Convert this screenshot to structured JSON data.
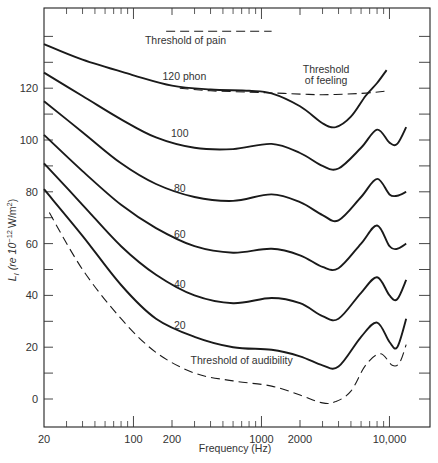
{
  "chart_data": {
    "type": "line",
    "title": "",
    "xlabel": "Frequency (Hz)",
    "ylabel": "L_I (re 10^-12 W/m^2)",
    "xscale": "log",
    "xlim": [
      20,
      16000
    ],
    "ylim": [
      -11,
      151
    ],
    "grid": false,
    "x_ticks": [
      {
        "value": 20,
        "label": "20"
      },
      {
        "value": 100,
        "label": "100"
      },
      {
        "value": 200,
        "label": "200"
      },
      {
        "value": 1000,
        "label": "1000"
      },
      {
        "value": 2000,
        "label": "2000"
      },
      {
        "value": 10000,
        "label": "10,000"
      }
    ],
    "x_minor_ticks": [
      30,
      40,
      50,
      60,
      70,
      80,
      90,
      300,
      400,
      500,
      600,
      700,
      800,
      900,
      3000,
      4000,
      5000,
      6000,
      7000,
      8000,
      9000
    ],
    "y_ticks": [
      {
        "value": 0,
        "label": "0"
      },
      {
        "value": 20,
        "label": "20"
      },
      {
        "value": 40,
        "label": "40"
      },
      {
        "value": 60,
        "label": "60"
      },
      {
        "value": 80,
        "label": "80"
      },
      {
        "value": 100,
        "label": "100"
      },
      {
        "value": 120,
        "label": "120"
      }
    ],
    "y_minor_ticks": [
      10,
      30,
      50,
      70,
      90,
      110,
      130,
      140
    ],
    "series": [
      {
        "name": "120 phon",
        "style": "solid",
        "x": [
          20,
          40,
          100,
          200,
          400,
          800,
          1200,
          2000,
          3000,
          3800,
          5000,
          6500,
          8000,
          9500
        ],
        "y": [
          137,
          131,
          125,
          121,
          119.5,
          119,
          118,
          113,
          106.5,
          105,
          109,
          117,
          122,
          127
        ]
      },
      {
        "name": "100",
        "style": "solid",
        "x": [
          20,
          40,
          80,
          150,
          300,
          600,
          1200,
          2000,
          3000,
          4000,
          6000,
          8000,
          10000,
          11500,
          13500
        ],
        "y": [
          126,
          117,
          108,
          101,
          97,
          96.5,
          98.5,
          95,
          90,
          89,
          97,
          104,
          99,
          98.5,
          105
        ]
      },
      {
        "name": "80",
        "style": "solid",
        "x": [
          20,
          40,
          80,
          150,
          300,
          600,
          1200,
          2000,
          3000,
          4000,
          6000,
          8000,
          10000,
          11500,
          13500
        ],
        "y": [
          115,
          103,
          91,
          83,
          78,
          76.5,
          79,
          76,
          71,
          69,
          78,
          85,
          79,
          78.5,
          80
        ]
      },
      {
        "name": "60",
        "style": "solid",
        "x": [
          20,
          40,
          80,
          150,
          300,
          600,
          1200,
          2000,
          3000,
          4000,
          6000,
          8000,
          10000,
          11500,
          13500
        ],
        "y": [
          102,
          88,
          75,
          66,
          59,
          56.5,
          58,
          55.5,
          51,
          50.5,
          60,
          67,
          59,
          58,
          60
        ]
      },
      {
        "name": "40",
        "style": "solid",
        "x": [
          20,
          40,
          80,
          150,
          300,
          600,
          1200,
          2000,
          3000,
          4000,
          6000,
          8000,
          10000,
          11500,
          13500
        ],
        "y": [
          91,
          75,
          59,
          48,
          40,
          37,
          39,
          37,
          32,
          31,
          41,
          47,
          40,
          38.5,
          46
        ]
      },
      {
        "name": "20",
        "style": "solid",
        "x": [
          20,
          40,
          80,
          150,
          300,
          600,
          1200,
          2000,
          3000,
          4000,
          6000,
          8000,
          10000,
          11500,
          13500
        ],
        "y": [
          81,
          63,
          44,
          31,
          24,
          20,
          19,
          16.5,
          13,
          12.5,
          24,
          29.5,
          22,
          20,
          31
        ]
      },
      {
        "name": "Threshold of audibility",
        "style": "dashed",
        "x": [
          22,
          40,
          80,
          150,
          300,
          600,
          1200,
          2000,
          3000,
          3800,
          5000,
          6500,
          8500,
          10500,
          12000,
          13500
        ],
        "y": [
          72,
          50,
          31,
          18,
          10,
          7,
          5,
          1.5,
          -1.5,
          -1,
          3,
          13,
          17.5,
          13,
          14,
          21
        ]
      },
      {
        "name": "Threshold of feeling",
        "style": "dashed",
        "x": [
          230,
          400,
          800,
          1500,
          3000,
          6000,
          10000
        ],
        "y": [
          120,
          119,
          118.5,
          118,
          117.5,
          118,
          119
        ]
      },
      {
        "name": "Threshold of pain",
        "style": "dashed",
        "x": [
          180,
          1200
        ],
        "y": [
          142,
          142
        ]
      }
    ],
    "annotations": [
      {
        "text": "Threshold of pain",
        "x": 255,
        "y": 137
      },
      {
        "text": "120 phon",
        "x": 250,
        "y": 123
      },
      {
        "text": "Threshold",
        "x": 3200,
        "y": 126
      },
      {
        "text": "of feeling",
        "x": 3200,
        "y": 121.5
      },
      {
        "text": "100",
        "x": 230,
        "y": 101
      },
      {
        "text": "80",
        "x": 230,
        "y": 80
      },
      {
        "text": "60",
        "x": 230,
        "y": 62
      },
      {
        "text": "40",
        "x": 230,
        "y": 43
      },
      {
        "text": "20",
        "x": 230,
        "y": 27
      },
      {
        "text": "Threshold of audibility",
        "x": 700,
        "y": 13.5
      }
    ]
  },
  "axes": {
    "xlabel": "Frequency (Hz)",
    "ylabel_main": "L",
    "ylabel_sub": "I",
    "ylabel_rest": "(re 10",
    "ylabel_exp": "−12",
    "ylabel_unit": "W/m",
    "ylabel_unit_exp": "2",
    "ylabel_close": ")"
  }
}
